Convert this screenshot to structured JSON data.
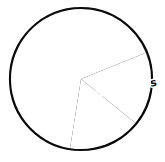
{
  "chart_data": {
    "type": "pie",
    "title": "",
    "subtitle": "",
    "xlabel": "",
    "ylabel": "",
    "legend_position": "none",
    "grid": false,
    "style": "hand-drawn black and white outline pie, unfilled slices, rotated slice labels",
    "stroke_color": "#0a0a0a",
    "fill_color": "#ffffff",
    "center_x": 81,
    "center_y": 79,
    "radius": 70,
    "start_angle_deg": 0,
    "direction": "clockwise",
    "labels": [
      "Cats",
      "Hamsters",
      "Birds",
      "Dogs"
    ],
    "values": [
      19,
      17,
      17,
      47
    ],
    "units": "percent",
    "slices": [
      {
        "label": "Cats",
        "value": 19,
        "start_angle_deg": 0,
        "end_angle_deg": 68,
        "label_x": 113,
        "label_y": 40,
        "label_rotation_deg": -42,
        "label_font_size": 11
      },
      {
        "label": "Hamsters",
        "value": 17,
        "start_angle_deg": 68,
        "end_angle_deg": 129,
        "label_x": 127,
        "label_y": 88,
        "label_rotation_deg": -10,
        "label_font_size": 11
      },
      {
        "label": "Birds",
        "value": 17,
        "start_angle_deg": 129,
        "end_angle_deg": 189,
        "label_x": 105,
        "label_y": 121,
        "label_rotation_deg": 62,
        "label_font_size": 10
      },
      {
        "label": "Dogs",
        "value": 47,
        "start_angle_deg": 189,
        "end_angle_deg": 360,
        "label_x": 46,
        "label_y": 80,
        "label_rotation_deg": 0,
        "label_font_size": 11
      }
    ]
  }
}
